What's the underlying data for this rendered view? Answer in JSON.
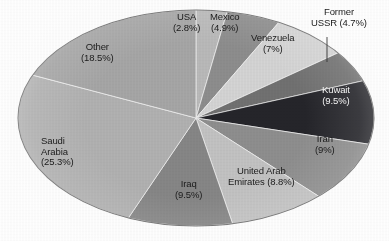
{
  "figure": {
    "name": "world-oil-reserves-pie-chart",
    "background_color": "#fdfdfd",
    "outline_color": "#6e6e6e"
  },
  "chart_data": {
    "type": "pie",
    "title": "",
    "subtitle": "",
    "xlabel": "",
    "ylabel": "",
    "grid": false,
    "legend_position": "none",
    "label_format": "name (value%)",
    "start_angle_deg": 0,
    "direction": "clockwise",
    "categories": [
      "USA",
      "Mexico",
      "Venezuela",
      "Former USSR",
      "Kuwait",
      "Iran",
      "United Arab Emirates",
      "Iraq",
      "Saudi Arabia",
      "Other"
    ],
    "values": [
      2.8,
      4.9,
      7,
      4.7,
      9.5,
      9,
      8.8,
      9.5,
      25.3,
      18.5
    ],
    "value_strings": [
      "2.8%",
      "4.9%",
      "7%",
      "4.7%",
      "9.5%",
      "9%",
      "8.8%",
      "9.5%",
      "25.3%",
      "18.5%"
    ],
    "colors": [
      "#b9b9b9",
      "#8d8d8d",
      "#d4d4d4",
      "#717171",
      "#25252a",
      "#8e8e8e",
      "#c2c2c2",
      "#868686",
      "#b1b1b1",
      "#a6a6a6"
    ],
    "slices": [
      {
        "name": "USA",
        "value": 2.8,
        "value_string": "2.8%",
        "label_line1": "USA",
        "label_line2": "(2.8%)",
        "color": "#b9b9b9",
        "label_color": "dark",
        "label_x": 186,
        "label_y": 12,
        "label_align": "center",
        "leader": false
      },
      {
        "name": "Mexico",
        "value": 4.9,
        "value_string": "4.9%",
        "label_line1": "Mexico",
        "label_line2": "(4.9%)",
        "color": "#8d8d8d",
        "label_color": "dark",
        "label_x": 225,
        "label_y": 12,
        "label_align": "center",
        "leader": false
      },
      {
        "name": "Venezuela",
        "value": 7,
        "value_string": "7%",
        "label_line1": "Venezuela",
        "label_line2": "(7%)",
        "color": "#d4d4d4",
        "label_color": "dark",
        "label_x": 272,
        "label_y": 33,
        "label_align": "center",
        "leader": false
      },
      {
        "name": "Former USSR",
        "value": 4.7,
        "value_string": "4.7%",
        "label_line1": "Former",
        "label_line2": "USSR (4.7%)",
        "color": "#717171",
        "label_color": "dark",
        "label_x": 339,
        "label_y": 7,
        "label_align": "center",
        "leader": true,
        "leader_x1": 327,
        "leader_y1": 37,
        "leader_x2": 327,
        "leader_y2": 62
      },
      {
        "name": "Kuwait",
        "value": 9.5,
        "value_string": "9.5%",
        "label_line1": "Kuwait",
        "label_line2": "(9.5%)",
        "color": "#25252a",
        "label_color": "light",
        "label_x": 336,
        "label_y": 85,
        "label_align": "center",
        "leader": false
      },
      {
        "name": "Iran",
        "value": 9,
        "value_string": "9%",
        "label_line1": "Iran",
        "label_line2": "(9%)",
        "color": "#8e8e8e",
        "label_color": "dark",
        "label_x": 325,
        "label_y": 134,
        "label_align": "center",
        "leader": false
      },
      {
        "name": "United Arab Emirates",
        "value": 8.8,
        "value_string": "8.8%",
        "label_line1": "United Arab",
        "label_line2": "Emirates (8.8%)",
        "color": "#c2c2c2",
        "label_color": "dark",
        "label_x": 261,
        "label_y": 166,
        "label_align": "center",
        "leader": false
      },
      {
        "name": "Iraq",
        "value": 9.5,
        "value_string": "9.5%",
        "label_line1": "Iraq",
        "label_line2": "(9.5%)",
        "color": "#868686",
        "label_color": "dark",
        "label_x": 188,
        "label_y": 179,
        "label_align": "center",
        "leader": false
      },
      {
        "name": "Saudi Arabia",
        "value": 25.3,
        "value_string": "25.3%",
        "label_line1": "Saudi",
        "label_line2": "Arabia",
        "label_line3": "(25.3%)",
        "color": "#b1b1b1",
        "label_color": "dark",
        "label_x": 41,
        "label_y": 136,
        "label_align": "left",
        "leader": false
      },
      {
        "name": "Other",
        "value": 18.5,
        "value_string": "18.5%",
        "label_line1": "Other",
        "label_line2": "(18.5%)",
        "color": "#a6a6a6",
        "label_color": "dark",
        "label_x": 97,
        "label_y": 42,
        "label_align": "center",
        "leader": false
      }
    ],
    "geometry": {
      "center_x": 196,
      "center_y": 118,
      "radius_x": 178,
      "radius_y": 108
    }
  }
}
